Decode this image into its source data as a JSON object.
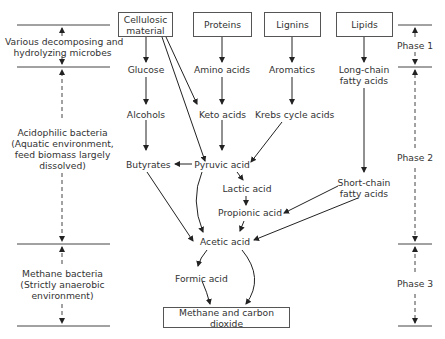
{
  "diagram": {
    "sources": [
      {
        "id": "cellulosic",
        "label_line1": "Cellulosic",
        "label_line2": "material"
      },
      {
        "id": "proteins",
        "label": "Proteins"
      },
      {
        "id": "lignins",
        "label": "Lignins"
      },
      {
        "id": "lipids",
        "label": "Lipids"
      }
    ],
    "intermediates": {
      "glucose": "Glucose",
      "amino_acids": "Amino acids",
      "aromatics": "Aromatics",
      "long_chain_line1": "Long-chain",
      "long_chain_line2": "fatty acids",
      "alcohols": "Alcohols",
      "keto_acids": "Keto acids",
      "krebs": "Krebs cycle acids",
      "butyrates": "Butyrates",
      "pyruvic": "Pyruvic acid",
      "lactic": "Lactic acid",
      "short_chain_line1": "Short-chain",
      "short_chain_line2": "fatty acids",
      "propionic": "Propionic acid",
      "acetic": "Acetic acid",
      "formic": "Formic acid"
    },
    "product": "Methane and carbon dioxide",
    "left_labels": {
      "microbes_line1": "Various decomposing and",
      "microbes_line2": "hydrolyzing microbes",
      "acido_line1": "Acidophilic bacteria",
      "acido_line2": "(Aquatic environment,",
      "acido_line3": "feed biomass largely",
      "acido_line4": "dissolved)",
      "methane_line1": "Methane bacteria",
      "methane_line2": "(Strictly anaerobic",
      "methane_line3": "environment)"
    },
    "phases": [
      "Phase 1",
      "Phase 2",
      "Phase 3"
    ]
  }
}
